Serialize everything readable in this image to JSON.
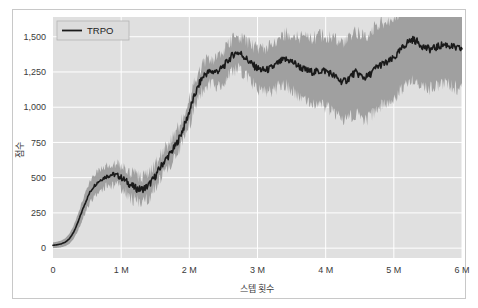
{
  "figure": {
    "background_color": "#ffffff",
    "frame_color": "#c8c8c8",
    "plot_background_color": "#e0e0e0",
    "grid_color": "#ffffff"
  },
  "chart_data": {
    "type": "line",
    "title": "",
    "xlabel": "스텝 횟수",
    "ylabel": "점수",
    "xlim": [
      0,
      6000000
    ],
    "ylim": [
      -70,
      1640
    ],
    "grid": true,
    "legend_position": "upper-left",
    "legend": [
      "TRPO"
    ],
    "line_color": "#1a1a1a",
    "band_color": "#a0a0a0",
    "band_label": "신뢰 구간",
    "xticks": [
      0,
      1000000,
      2000000,
      3000000,
      4000000,
      5000000,
      6000000
    ],
    "xticklabels": [
      "0",
      "1 M",
      "2 M",
      "3 M",
      "4 M",
      "5 M",
      "6 M"
    ],
    "yticks": [
      0,
      250,
      500,
      750,
      1000,
      1250,
      1500
    ],
    "yticklabels": [
      "0",
      "250",
      "500",
      "750",
      "1,000",
      "1,250",
      "1,500"
    ],
    "series": [
      {
        "name": "TRPO",
        "x": [
          0,
          60000,
          120000,
          180000,
          240000,
          300000,
          360000,
          420000,
          480000,
          540000,
          600000,
          660000,
          720000,
          780000,
          840000,
          900000,
          960000,
          1020000,
          1080000,
          1140000,
          1200000,
          1260000,
          1320000,
          1380000,
          1440000,
          1500000,
          1560000,
          1620000,
          1680000,
          1740000,
          1800000,
          1860000,
          1920000,
          1980000,
          2040000,
          2100000,
          2160000,
          2220000,
          2280000,
          2340000,
          2400000,
          2460000,
          2520000,
          2580000,
          2640000,
          2700000,
          2760000,
          2820000,
          2880000,
          2940000,
          3000000,
          3060000,
          3120000,
          3180000,
          3240000,
          3300000,
          3360000,
          3420000,
          3480000,
          3540000,
          3600000,
          3660000,
          3720000,
          3780000,
          3840000,
          3900000,
          3960000,
          4020000,
          4080000,
          4140000,
          4200000,
          4260000,
          4320000,
          4380000,
          4440000,
          4500000,
          4560000,
          4620000,
          4680000,
          4740000,
          4800000,
          4860000,
          4920000,
          4980000,
          5040000,
          5100000,
          5160000,
          5220000,
          5280000,
          5340000,
          5400000,
          5460000,
          5520000,
          5580000,
          5640000,
          5700000,
          5760000,
          5820000,
          5880000,
          5940000,
          6000000
        ],
        "values": [
          20,
          24,
          30,
          42,
          66,
          110,
          175,
          255,
          330,
          395,
          440,
          470,
          492,
          508,
          520,
          522,
          512,
          495,
          472,
          448,
          428,
          418,
          420,
          436,
          468,
          510,
          560,
          608,
          646,
          684,
          728,
          790,
          860,
          940,
          1030,
          1110,
          1180,
          1230,
          1248,
          1252,
          1255,
          1268,
          1300,
          1338,
          1372,
          1390,
          1378,
          1352,
          1322,
          1296,
          1276,
          1264,
          1262,
          1272,
          1290,
          1312,
          1330,
          1338,
          1330,
          1312,
          1292,
          1274,
          1260,
          1252,
          1250,
          1254,
          1262,
          1254,
          1238,
          1216,
          1192,
          1180,
          1196,
          1228,
          1246,
          1228,
          1210,
          1218,
          1248,
          1280,
          1300,
          1308,
          1320,
          1340,
          1368,
          1404,
          1440,
          1468,
          1480,
          1466,
          1442,
          1422,
          1412,
          1416,
          1428,
          1440,
          1444,
          1436,
          1424,
          1416,
          1414
        ],
        "lower": [
          0,
          2,
          6,
          14,
          30,
          62,
          118,
          190,
          262,
          322,
          366,
          398,
          424,
          442,
          452,
          452,
          440,
          420,
          396,
          370,
          348,
          338,
          340,
          356,
          390,
          434,
          486,
          534,
          572,
          610,
          652,
          712,
          780,
          858,
          946,
          1028,
          1098,
          1148,
          1164,
          1164,
          1162,
          1172,
          1200,
          1236,
          1268,
          1282,
          1266,
          1236,
          1200,
          1168,
          1142,
          1124,
          1116,
          1120,
          1132,
          1148,
          1160,
          1160,
          1144,
          1118,
          1090,
          1062,
          1038,
          1022,
          1012,
          1014,
          1020,
          1010,
          990,
          962,
          932,
          914,
          926,
          954,
          968,
          946,
          924,
          930,
          958,
          992,
          1014,
          1022,
          1034,
          1056,
          1086,
          1124,
          1162,
          1192,
          1206,
          1192,
          1168,
          1148,
          1138,
          1142,
          1154,
          1166,
          1170,
          1162,
          1150,
          1142,
          1140
        ],
        "upper": [
          40,
          46,
          54,
          70,
          102,
          158,
          232,
          320,
          398,
          468,
          514,
          542,
          560,
          574,
          588,
          592,
          584,
          570,
          548,
          526,
          508,
          498,
          500,
          516,
          546,
          586,
          634,
          682,
          720,
          758,
          804,
          868,
          940,
          1022,
          1114,
          1192,
          1262,
          1312,
          1332,
          1340,
          1348,
          1364,
          1400,
          1440,
          1476,
          1498,
          1490,
          1468,
          1444,
          1424,
          1410,
          1404,
          1408,
          1424,
          1448,
          1476,
          1500,
          1516,
          1516,
          1506,
          1494,
          1486,
          1482,
          1482,
          1488,
          1494,
          1504,
          1498,
          1486,
          1470,
          1452,
          1446,
          1466,
          1502,
          1524,
          1510,
          1496,
          1506,
          1538,
          1568,
          1586,
          1594,
          1606,
          1624,
          1650,
          1682,
          1718,
          1744,
          1754,
          1740,
          1716,
          1696,
          1686,
          1690,
          1702,
          1714,
          1718,
          1710,
          1698,
          1690,
          1688
        ]
      }
    ]
  },
  "legend": {
    "entries": [
      {
        "label": "TRPO",
        "color": "#1a1a1a"
      }
    ]
  }
}
